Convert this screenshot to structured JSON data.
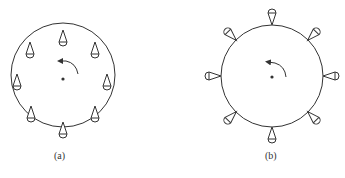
{
  "figures": [
    {
      "id": "a",
      "caption": "(a)",
      "center": [
        63,
        75
      ],
      "radius": 52,
      "cup_orientation": "vertical-up",
      "cup_count": 8,
      "rotation_arrow": "counterclockwise"
    },
    {
      "id": "b",
      "caption": "(b)",
      "center": [
        272,
        76
      ],
      "radius": 51,
      "cup_orientation": "radial-inward",
      "cup_count": 8,
      "rotation_arrow": "counterclockwise"
    }
  ],
  "colors": {
    "stroke": "#333333",
    "background": "#ffffff"
  }
}
